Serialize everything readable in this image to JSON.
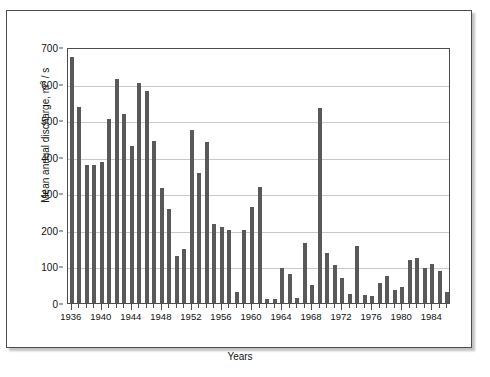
{
  "chart_data": {
    "type": "bar",
    "title": "",
    "xlabel": "Years",
    "ylabel": "Mean annual discharge, m³ / s",
    "ylabel_parts": {
      "prefix": "Mean annual discharge, m",
      "sup": "3",
      "suffix": " / s"
    },
    "ylim": [
      0,
      700
    ],
    "ytick_step": 100,
    "yticks": [
      0,
      100,
      200,
      300,
      400,
      500,
      600,
      700
    ],
    "xlim": [
      1935.5,
      1986.5
    ],
    "xtick_labels": [
      1936,
      1940,
      1944,
      1948,
      1952,
      1956,
      1960,
      1964,
      1968,
      1972,
      1976,
      1980,
      1984
    ],
    "xtick_every": 1,
    "xlabel_every": 4,
    "grid": "horizontal",
    "legend": "none",
    "bar_color": "#595959",
    "categories": [
      1936,
      1937,
      1938,
      1939,
      1940,
      1941,
      1942,
      1943,
      1944,
      1945,
      1946,
      1947,
      1948,
      1949,
      1950,
      1951,
      1952,
      1953,
      1954,
      1955,
      1956,
      1957,
      1958,
      1959,
      1960,
      1961,
      1962,
      1963,
      1964,
      1965,
      1966,
      1967,
      1968,
      1969,
      1970,
      1971,
      1972,
      1973,
      1974,
      1975,
      1976,
      1977,
      1978,
      1979,
      1980,
      1981,
      1982,
      1983,
      1984,
      1985,
      1986
    ],
    "values": [
      672,
      537,
      378,
      378,
      385,
      503,
      612,
      517,
      428,
      602,
      580,
      443,
      315,
      258,
      128,
      148,
      472,
      355,
      440,
      215,
      207,
      200,
      30,
      200,
      262,
      318,
      10,
      12,
      95,
      80,
      15,
      165,
      50,
      533,
      138,
      105,
      68,
      25,
      155,
      22,
      20,
      55,
      75,
      35,
      45,
      118,
      122,
      95,
      107,
      88,
      30
    ]
  }
}
